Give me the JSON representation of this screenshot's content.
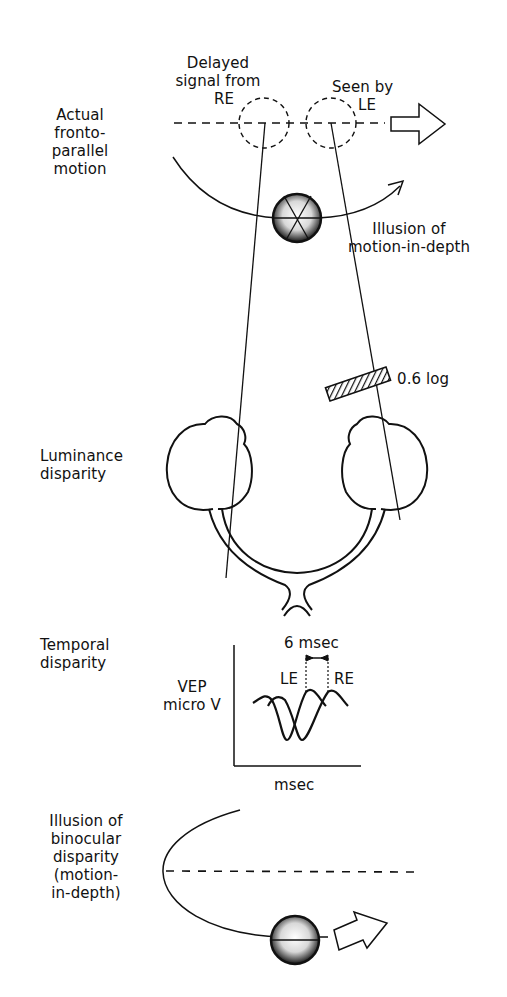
{
  "figure": {
    "panels": [
      {
        "id": "actual-motion",
        "side_label": [
          "Actual",
          "fronto-",
          "parallel",
          "motion"
        ],
        "annotations": {
          "delayed": [
            "Delayed",
            "signal from",
            "RE"
          ],
          "seen_by": [
            "Seen by",
            "LE"
          ],
          "illusion": [
            "Illusion of",
            "motion-in-depth"
          ]
        }
      },
      {
        "id": "luminance-disparity",
        "side_label": [
          "Luminance",
          "disparity"
        ],
        "filter_label": "0.6 log"
      },
      {
        "id": "temporal-disparity",
        "side_label": [
          "Temporal",
          "disparity"
        ],
        "plot": {
          "ylabel": [
            "VEP",
            "micro V"
          ],
          "xlabel": "msec",
          "delay_label": "6 msec",
          "curve_labels": {
            "left": "LE",
            "right": "RE"
          }
        }
      },
      {
        "id": "binocular-illusion",
        "side_label": [
          "Illusion of",
          "binocular",
          "disparity",
          "(motion-",
          "in-depth)"
        ]
      }
    ],
    "colors": {
      "ink": "#111111",
      "background": "#ffffff"
    }
  }
}
